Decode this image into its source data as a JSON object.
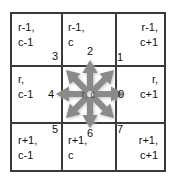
{
  "figure": {
    "center_label": "r, c",
    "grid_line_color": "#3a3a3a",
    "arrow_color": "#8c8c8c",
    "arrow_shadow_color": "#bdbdbd",
    "background_color": "#ffffff",
    "text_color": "#111111"
  },
  "cells": [
    {
      "id": "top-left",
      "row": 0,
      "col": 0,
      "align": "left",
      "lines": [
        "r-1,",
        "c-1"
      ]
    },
    {
      "id": "top-center",
      "row": 0,
      "col": 1,
      "align": "left",
      "lines": [
        "r-1,",
        "c"
      ]
    },
    {
      "id": "top-right",
      "row": 0,
      "col": 2,
      "align": "right",
      "lines": [
        "r-1,",
        "c+1"
      ]
    },
    {
      "id": "middle-left",
      "row": 1,
      "col": 0,
      "align": "left",
      "lines": [
        "r,",
        "c-1"
      ]
    },
    {
      "id": "middle-center",
      "row": 1,
      "col": 1,
      "align": "left",
      "lines": [
        "",
        ""
      ]
    },
    {
      "id": "middle-right",
      "row": 1,
      "col": 2,
      "align": "right",
      "lines": [
        "r,",
        "c+1"
      ]
    },
    {
      "id": "bottom-left",
      "row": 2,
      "col": 0,
      "align": "left",
      "lines": [
        "r+1,",
        "c-1"
      ]
    },
    {
      "id": "bottom-center",
      "row": 2,
      "col": 1,
      "align": "left",
      "lines": [
        "r+1,",
        "c"
      ]
    },
    {
      "id": "bottom-right",
      "row": 2,
      "col": 2,
      "align": "right",
      "lines": [
        "r+1,",
        "c+1"
      ]
    }
  ],
  "directions": [
    {
      "code": "0",
      "name": "east",
      "angle_deg": 0
    },
    {
      "code": "1",
      "name": "north-east",
      "angle_deg": 45
    },
    {
      "code": "2",
      "name": "north",
      "angle_deg": 90
    },
    {
      "code": "3",
      "name": "north-west",
      "angle_deg": 135
    },
    {
      "code": "4",
      "name": "west",
      "angle_deg": 180
    },
    {
      "code": "5",
      "name": "south-west",
      "angle_deg": 225
    },
    {
      "code": "6",
      "name": "south",
      "angle_deg": 270
    },
    {
      "code": "7",
      "name": "south-east",
      "angle_deg": 315
    }
  ]
}
